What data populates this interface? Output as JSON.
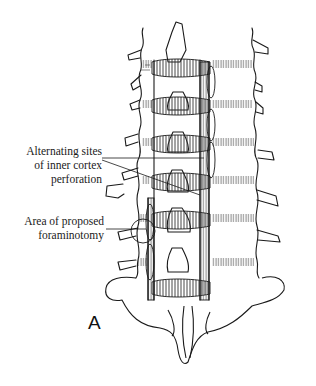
{
  "figure": {
    "panel_label": "A",
    "annotations": [
      {
        "id": "alternating-sites",
        "lines": [
          "Alternating sites",
          "of inner cortex",
          "perforation"
        ]
      },
      {
        "id": "proposed-foraminotomy",
        "lines": [
          "Area of proposed",
          "foraminotomy"
        ]
      }
    ],
    "colors": {
      "ink": "#1a1a1a",
      "background": "#ffffff",
      "hatch": "#333333"
    }
  }
}
